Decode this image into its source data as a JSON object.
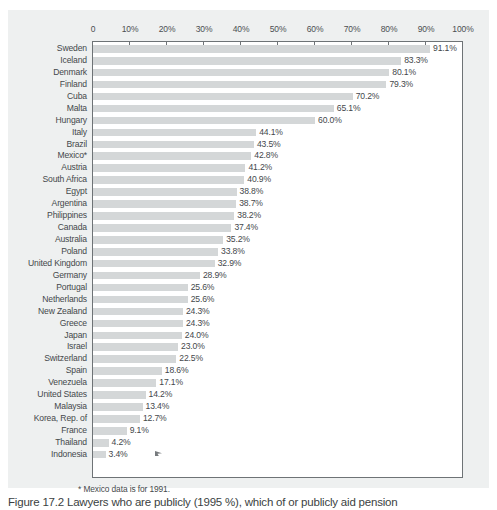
{
  "figure": {
    "footnote": "* Mexico data is for 1991.",
    "caption": "Figure 17.2  Lawyers who are publicly (1995 %), which of or publicly aid pension",
    "cursor_icon": "arrow-cursor-icon"
  },
  "colors": {
    "panel_background": "#eef0f0",
    "plot_background": "#ffffff",
    "bar_fill": "#d4d7d8",
    "axis_line": "#6e7376",
    "text": "#44484b"
  },
  "chart_data": {
    "type": "bar",
    "orientation": "horizontal",
    "title": "",
    "xlabel": "",
    "ylabel": "",
    "xlim": [
      0,
      100
    ],
    "grid": false,
    "legend": null,
    "value_suffix": "%",
    "xticks": [
      0,
      10,
      20,
      30,
      40,
      50,
      60,
      70,
      80,
      90,
      100
    ],
    "xtick_labels": [
      "0",
      "10%",
      "20%",
      "30%",
      "40%",
      "50%",
      "60%",
      "70%",
      "80%",
      "90%",
      "100%"
    ],
    "categories": [
      "Sweden",
      "Iceland",
      "Denmark",
      "Finland",
      "Cuba",
      "Malta",
      "Hungary",
      "Italy",
      "Brazil",
      "Mexico*",
      "Austria",
      "South Africa",
      "Egypt",
      "Argentina",
      "Philippines",
      "Canada",
      "Australia",
      "Poland",
      "United Kingdom",
      "Germany",
      "Portugal",
      "Netherlands",
      "New Zealand",
      "Greece",
      "Japan",
      "Israel",
      "Switzerland",
      "Spain",
      "Venezuela",
      "United States",
      "Malaysia",
      "Korea, Rep. of",
      "France",
      "Thailand",
      "Indonesia"
    ],
    "values": [
      91.1,
      83.3,
      80.1,
      79.3,
      70.2,
      65.1,
      60.0,
      44.1,
      43.5,
      42.8,
      41.2,
      40.9,
      38.8,
      38.7,
      38.2,
      37.4,
      35.2,
      33.8,
      32.9,
      28.9,
      25.6,
      25.6,
      24.3,
      24.3,
      24.0,
      23.0,
      22.5,
      18.6,
      17.1,
      14.2,
      13.4,
      12.7,
      9.1,
      4.2,
      3.4
    ],
    "value_labels": [
      "91.1%",
      "83.3%",
      "80.1%",
      "79.3%",
      "70.2%",
      "65.1%",
      "60.0%",
      "44.1%",
      "43.5%",
      "42.8%",
      "41.2%",
      "40.9%",
      "38.8%",
      "38.7%",
      "38.2%",
      "37.4%",
      "35.2%",
      "33.8%",
      "32.9%",
      "28.9%",
      "25.6%",
      "25.6%",
      "24.3%",
      "24.3%",
      "24.0%",
      "23.0%",
      "22.5%",
      "18.6%",
      "17.1%",
      "14.2%",
      "13.4%",
      "12.7%",
      "9.1%",
      "4.2%",
      "3.4%"
    ]
  }
}
